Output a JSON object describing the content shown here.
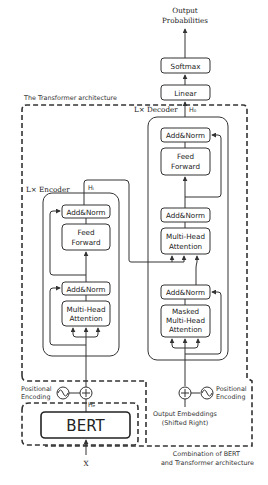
{
  "diagram": {
    "output": {
      "line1": "Output",
      "line2": "Probabilities"
    },
    "softmax": "Softmax",
    "linear": "Linear",
    "transformer_title": "The Transformer architecture",
    "decoder": {
      "label": "L× Decoder",
      "hidden_label": "H₀",
      "blocks": {
        "add_norm_top": "Add&Norm",
        "feed_forward_1": "Feed",
        "feed_forward_2": "Forward",
        "add_norm_mid": "Add&Norm",
        "mha_1": "Multi-Head",
        "mha_2": "Attention",
        "add_norm_bottom": "Add&Norm",
        "masked_1": "Masked",
        "masked_2": "Multi-Head",
        "masked_3": "Attention"
      },
      "positional_encoding_1": "Positional",
      "positional_encoding_2": "Encoding",
      "input_1": "Output Embeddings",
      "input_2": "(Shifted Right)"
    },
    "encoder": {
      "label": "L× Encoder",
      "hidden_label": "Hᵢ",
      "blocks": {
        "add_norm_top": "Add&Norm",
        "feed_forward_1": "Feed",
        "feed_forward_2": "Forward",
        "add_norm_bottom": "Add&Norm",
        "mha_1": "Multi-Head",
        "mha_2": "Attention"
      },
      "positional_encoding_1": "Positional",
      "positional_encoding_2": "Encoding",
      "bert_hidden_label": "Hₑ",
      "bert": "BERT",
      "input": "X"
    },
    "caption_1": "Combination of BERT",
    "caption_2": "and Transformer architecture"
  }
}
